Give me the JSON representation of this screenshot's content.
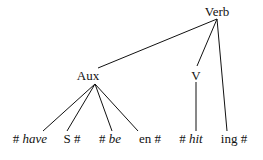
{
  "tree": {
    "root": "Verb",
    "nodes": {
      "verb": "Verb",
      "aux": "Aux",
      "v": "V"
    },
    "leaves": [
      {
        "hash_before": "#",
        "word": "have",
        "italic": true,
        "hash_after": ""
      },
      {
        "hash_before": "",
        "word": "S",
        "italic": false,
        "hash_after": "#"
      },
      {
        "hash_before": "#",
        "word": "be",
        "italic": true,
        "hash_after": ""
      },
      {
        "hash_before": "",
        "word": "en",
        "italic": false,
        "hash_after": "#"
      },
      {
        "hash_before": "#",
        "word": "hit",
        "italic": true,
        "hash_after": ""
      },
      {
        "hash_before": "",
        "word": "ing",
        "italic": false,
        "hash_after": "#"
      }
    ]
  }
}
